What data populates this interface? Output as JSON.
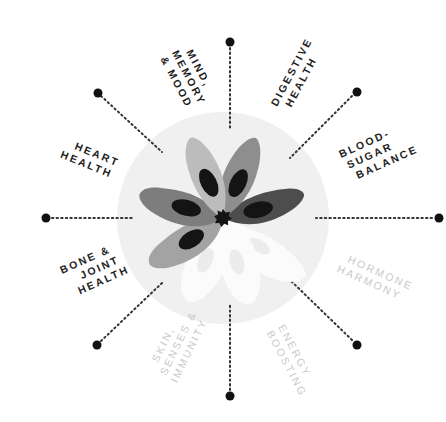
{
  "diagram": {
    "type": "radial-wheel",
    "colors": {
      "background_circle": "#f0f0f0",
      "petal_light": "#b3b3b3",
      "petal_mid": "#999999",
      "petal_dark": "#5f5f5f",
      "petal_darker": "#4a4a4a",
      "petal_inner": "#141414",
      "petal_inactive": "#fbfbfb",
      "dot": "#111111",
      "label_active": "#1e1e1e",
      "label_inactive": "#c9c9c9"
    },
    "categories": [
      {
        "id": "mind",
        "lines": [
          "MIND,",
          "MEMORY",
          "& MOOD"
        ],
        "active": true
      },
      {
        "id": "digestive",
        "lines": [
          "DIGESTIVE",
          "HEALTH"
        ],
        "active": true
      },
      {
        "id": "blood-sugar",
        "lines": [
          "BLOOD-",
          "SUGAR",
          "BALANCE"
        ],
        "active": true
      },
      {
        "id": "hormone",
        "lines": [
          "HORMONE",
          "HARMONY"
        ],
        "active": false
      },
      {
        "id": "energy",
        "lines": [
          "ENERGY",
          "BOOSTING"
        ],
        "active": false
      },
      {
        "id": "skin",
        "lines": [
          "SKIN,",
          "SENSES &",
          "IMMUNITY"
        ],
        "active": false
      },
      {
        "id": "bone",
        "lines": [
          "BONE &",
          "JOINT",
          "HEALTH"
        ],
        "active": true
      },
      {
        "id": "heart",
        "lines": [
          "HEART",
          "HEALTH"
        ],
        "active": true
      }
    ]
  },
  "labels": {
    "mind_1": "MIND,",
    "mind_2": "MEMORY",
    "mind_3": "& MOOD",
    "digestive_1": "DIGESTIVE",
    "digestive_2": "HEALTH",
    "blood_1": "BLOOD-",
    "blood_2": "SUGAR",
    "blood_3": "BALANCE",
    "hormone_1": "HORMONE",
    "hormone_2": "HARMONY",
    "energy_1": "ENERGY",
    "energy_2": "BOOSTING",
    "skin_1": "SKIN,",
    "skin_2": "SENSES &",
    "skin_3": "IMMUNITY",
    "bone_1": "BONE &",
    "bone_2": "JOINT",
    "bone_3": "HEALTH",
    "heart_1": "HEART",
    "heart_2": "HEALTH"
  }
}
